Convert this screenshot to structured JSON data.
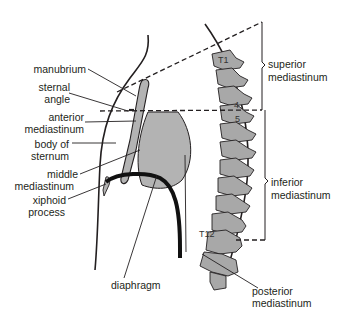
{
  "diagram": {
    "colors": {
      "line": "#231f20",
      "fill_gray": "#b3b3b3",
      "bone_gray": "#a8a8a8",
      "background": "#ffffff"
    },
    "labels": {
      "manubrium": "manubrium",
      "sternal_angle_1": "sternal",
      "sternal_angle_2": "angle",
      "anterior_mediastinum_1": "anterior",
      "anterior_mediastinum_2": "mediastinum",
      "body_of_sternum_1": "body of",
      "body_of_sternum_2": "sternum",
      "middle_mediastinum_1": "middle",
      "middle_mediastinum_2": "mediastinum",
      "xiphoid_process_1": "xiphoid",
      "xiphoid_process_2": "process",
      "diaphragm": "diaphragm",
      "superior_mediastinum_1": "superior",
      "superior_mediastinum_2": "mediastinum",
      "inferior_mediastinum_1": "inferior",
      "inferior_mediastinum_2": "mediastinum",
      "posterior_mediastinum_1": "posterior",
      "posterior_mediastinum_2": "mediastinum"
    },
    "vertebra_labels": {
      "t1": "T1",
      "t4": "4",
      "t5": "5",
      "t12": "T12"
    }
  }
}
